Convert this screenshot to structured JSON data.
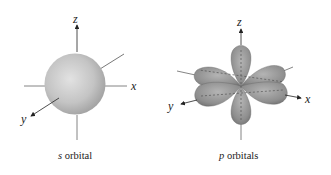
{
  "figures": [
    {
      "id": "s",
      "caption_letter": "s",
      "caption_text": " orbital",
      "axes": {
        "x": "x",
        "y": "y",
        "z": "z"
      },
      "shape": "sphere",
      "fill_color": "#c0c0c0"
    },
    {
      "id": "p",
      "caption_letter": "p",
      "caption_text": " orbitals",
      "axes": {
        "x": "x",
        "y": "y",
        "z": "z"
      },
      "shape": "dumbbell-lobes",
      "fill_color": "#8a8a8a"
    }
  ]
}
